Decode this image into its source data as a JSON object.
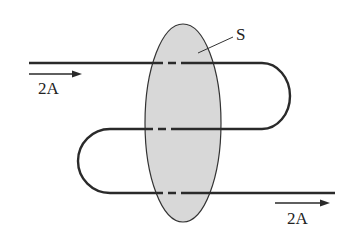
{
  "diagram": {
    "surface_label": "S",
    "current_in_label": "2A",
    "current_out_label": "2A",
    "colors": {
      "wire": "#2a2a2a",
      "surface_fill": "#d8d8d8",
      "surface_stroke": "#333333",
      "background": "#ffffff"
    }
  }
}
